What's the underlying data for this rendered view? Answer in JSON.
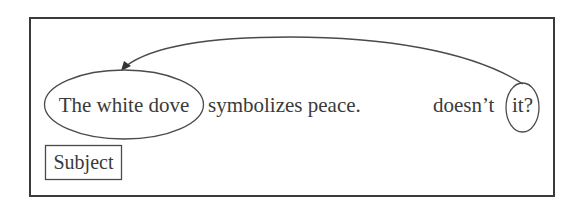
{
  "diagram": {
    "sentence": {
      "subject_phrase": "The white dove",
      "predicate": "symbolizes peace.",
      "tag_auxiliary": "doesn’t",
      "tag_pronoun": "it?"
    },
    "labels": {
      "subject": "Subject"
    },
    "connector": {
      "from": "it?",
      "to": "The white dove",
      "type": "curved-arrow"
    },
    "colors": {
      "stroke": "#3a3a3a",
      "text": "#3a3a3a",
      "background": "#ffffff"
    }
  }
}
